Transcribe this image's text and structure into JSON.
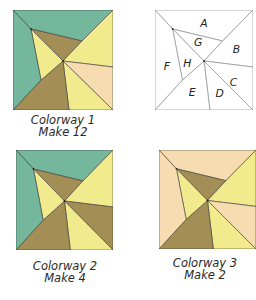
{
  "colors": {
    "teal": "#74b79c",
    "brown": "#a38e56",
    "yellow": "#f2eb8e",
    "peach": "#f6dcb0",
    "outline": "#3c3c3c",
    "label_line": "#9a9a9a"
  },
  "blocks": [
    {
      "id": "colorway-1",
      "caption_line1": "Colorway 1",
      "caption_line2": "Make 12",
      "fills": {
        "A": "teal",
        "B": "yellow",
        "C": "peach",
        "D": "yellow",
        "E": "brown",
        "F": "teal",
        "G": "brown",
        "H": "yellow"
      }
    },
    {
      "id": "piece-key",
      "labels": {
        "A": "A",
        "B": "B",
        "C": "C",
        "D": "D",
        "E": "E",
        "F": "F",
        "G": "G",
        "H": "H"
      }
    },
    {
      "id": "colorway-2",
      "caption_line1": "Colorway 2",
      "caption_line2": "Make 4",
      "fills": {
        "A": "teal",
        "B": "yellow",
        "C": "brown",
        "D": "yellow",
        "E": "brown",
        "F": "teal",
        "G": "brown",
        "H": "yellow"
      }
    },
    {
      "id": "colorway-3",
      "caption_line1": "Colorway 3",
      "caption_line2": "Make 2",
      "fills": {
        "A": "peach",
        "B": "yellow",
        "C": "peach",
        "D": "yellow",
        "E": "brown",
        "F": "peach",
        "G": "brown",
        "H": "yellow"
      }
    }
  ]
}
